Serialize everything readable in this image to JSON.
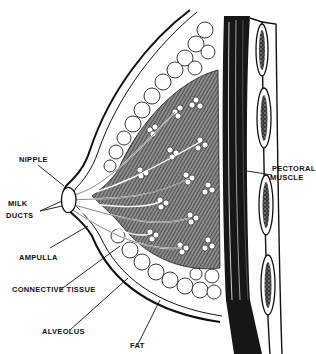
{
  "diagram": {
    "labels": {
      "nipple": "NIPPLE",
      "milk_ducts_line1": "MILK",
      "milk_ducts_line2": "DUCTS",
      "ampulla": "AMPULLA",
      "connective_tissue": "CONNECTIVE TISSUE",
      "alveolus": "ALVEOLUS",
      "fat": "FAT",
      "pectoral_line1": "PECTORAL",
      "pectoral_line2": "MUSCLE"
    },
    "colors": {
      "ink": "#111111",
      "background": "#ffffff",
      "muscle": "#1a1a1a",
      "tissue_shade": "#555555"
    }
  }
}
